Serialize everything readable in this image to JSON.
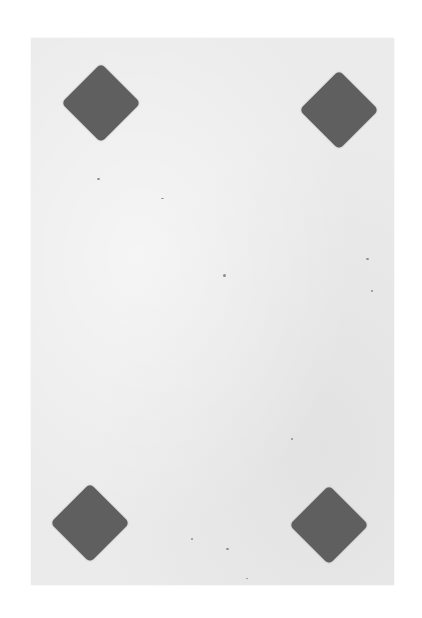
{
  "scene": {
    "description": "Photograph of a plain light-gray card with four dark gray diamond shapes, one near each corner",
    "background_color": "#ffffff",
    "card_color": "#ebebeb",
    "diamond_color": "#5f5f5f"
  },
  "card": {
    "diamonds": [
      {
        "position": "top-left",
        "cx": 101,
        "cy": 103
      },
      {
        "position": "top-right",
        "cx": 339,
        "cy": 110
      },
      {
        "position": "bottom-left",
        "cx": 90,
        "cy": 523
      },
      {
        "position": "bottom-right",
        "cx": 329,
        "cy": 525
      }
    ]
  }
}
